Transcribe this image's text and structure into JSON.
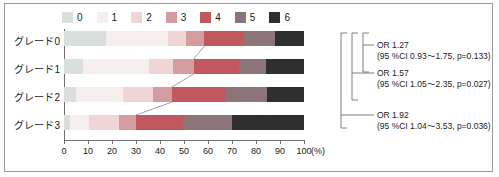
{
  "chart_data": {
    "type": "bar",
    "orientation": "horizontal",
    "stacked": true,
    "stack_unit": "percent",
    "title": "",
    "xlabel": "(%)",
    "ylabel": "",
    "xlim": [
      0,
      100
    ],
    "grid": false,
    "legend_position": "top",
    "categories": [
      "グレード0",
      "グレード1",
      "グレード2",
      "グレード3"
    ],
    "legend": [
      "0",
      "1",
      "2",
      "3",
      "4",
      "5",
      "6"
    ],
    "series": [
      {
        "name": "0",
        "color": "#d8dfdd",
        "values": [
          17.5,
          8.0,
          5.0,
          2.5
        ]
      },
      {
        "name": "1",
        "color": "#f7eeee",
        "values": [
          26.0,
          27.5,
          19.5,
          8.0
        ]
      },
      {
        "name": "2",
        "color": "#f0d5d6",
        "values": [
          7.5,
          10.0,
          12.5,
          12.5
        ]
      },
      {
        "name": "3",
        "color": "#d49ba0",
        "values": [
          7.5,
          8.5,
          8.0,
          7.0
        ]
      },
      {
        "name": "4",
        "color": "#c0585e",
        "values": [
          16.5,
          19.0,
          22.5,
          19.5
        ]
      },
      {
        "name": "5",
        "color": "#8c7579",
        "values": [
          13.0,
          11.0,
          17.0,
          20.5
        ]
      },
      {
        "name": "6",
        "color": "#2f2f2f",
        "values": [
          12.0,
          16.0,
          15.5,
          30.0
        ]
      }
    ],
    "xticks": [
      0,
      10,
      20,
      30,
      40,
      50,
      60,
      70,
      80,
      90,
      100
    ],
    "xtick_labels": [
      "0",
      "10",
      "20",
      "30",
      "40",
      "50",
      "60",
      "70",
      "80",
      "90",
      "100"
    ]
  },
  "legend": {
    "items": [
      {
        "label": "0",
        "color": "#d8dfdd"
      },
      {
        "label": "1",
        "color": "#f7eeee"
      },
      {
        "label": "2",
        "color": "#f0d5d6"
      },
      {
        "label": "3",
        "color": "#d49ba0"
      },
      {
        "label": "4",
        "color": "#c0585e"
      },
      {
        "label": "5",
        "color": "#8c7579"
      },
      {
        "label": "6",
        "color": "#2f2f2f"
      }
    ]
  },
  "rows": [
    {
      "label": "グレード0"
    },
    {
      "label": "グレード1"
    },
    {
      "label": "グレード2"
    },
    {
      "label": "グレード3"
    }
  ],
  "axis": {
    "unit": "(%)",
    "ticks": [
      "0",
      "10",
      "20",
      "30",
      "40",
      "50",
      "60",
      "70",
      "80",
      "90",
      "100"
    ]
  },
  "annotations": [
    {
      "or": "OR 1.27",
      "ci": "(95 %CI 0.93〜1.75, p=0.133)",
      "or_value": 1.27,
      "ci_low": 0.93,
      "ci_high": 1.75,
      "p_value": 0.133,
      "spans": [
        "グレード0",
        "グレード1"
      ]
    },
    {
      "or": "OR 1.57",
      "ci": "(95 %CI 1.05〜2.35, p=0.027)",
      "or_value": 1.57,
      "ci_low": 1.05,
      "ci_high": 2.35,
      "p_value": 0.027,
      "spans": [
        "グレード0",
        "グレード2"
      ]
    },
    {
      "or": "OR 1.92",
      "ci": "(95 %CI 1.04〜3.53, p=0.036)",
      "or_value": 1.92,
      "ci_low": 1.04,
      "ci_high": 3.53,
      "p_value": 0.036,
      "spans": [
        "グレード0",
        "グレード3"
      ]
    }
  ]
}
